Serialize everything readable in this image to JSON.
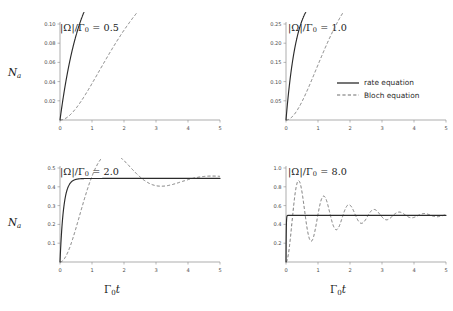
{
  "figure": {
    "axis_label_y": "N",
    "axis_label_y_sub": "a",
    "axis_label_x": "Γ",
    "axis_label_x_sub": "0",
    "axis_label_x_tail": "t",
    "background_color": "#ffffff",
    "solid_color": "#2b2b2b",
    "dashed_color": "#6e6e6e",
    "axis_color": "#8a8a8a"
  },
  "legend": {
    "position": "top-right-panel",
    "entries": [
      {
        "label": "rate equation",
        "style": "solid"
      },
      {
        "label": "Bloch equation",
        "style": "dashed"
      }
    ]
  },
  "chart_data": [
    {
      "type": "line",
      "panel": "top-left",
      "title": "|Ω|/Γ₀ = 0.5",
      "title_prefix": "|Ω|/Γ",
      "title_sub": "0",
      "title_value": "= 0.5",
      "rabi_ratio": 0.5,
      "xlabel": "Γ₀t",
      "ylabel": "Na",
      "xlim": [
        0,
        5
      ],
      "ylim": [
        0,
        0.1
      ],
      "xticks": [
        0,
        1,
        2,
        3,
        4,
        5
      ],
      "xtick_labels": [
        "0",
        "1",
        "2",
        "3",
        "4",
        "5"
      ],
      "yticks": [
        0.02,
        0.04,
        0.06,
        0.08,
        0.1
      ],
      "ytick_labels": [
        "0.02",
        "0.04",
        "0.06",
        "0.08",
        "0.10"
      ],
      "grid": false,
      "steady_state": 0.0556,
      "series": [
        {
          "name": "rate equation",
          "style": "solid",
          "model": "rate"
        },
        {
          "name": "Bloch equation",
          "style": "dashed",
          "model": "bloch"
        }
      ]
    },
    {
      "type": "line",
      "panel": "top-right",
      "title": "|Ω|/Γ₀ = 1.0",
      "title_prefix": "|Ω|/Γ",
      "title_sub": "0",
      "title_value": "= 1.0",
      "rabi_ratio": 1.0,
      "xlabel": "Γ₀t",
      "ylabel": "Na",
      "xlim": [
        0,
        5
      ],
      "ylim": [
        0,
        0.25
      ],
      "xticks": [
        0,
        1,
        2,
        3,
        4,
        5
      ],
      "xtick_labels": [
        "0",
        "1",
        "2",
        "3",
        "4",
        "5"
      ],
      "yticks": [
        0.05,
        0.1,
        0.15,
        0.2,
        0.25
      ],
      "ytick_labels": [
        "0.05",
        "0.10",
        "0.15",
        "0.20",
        "0.25"
      ],
      "grid": false,
      "steady_state": 0.1667,
      "series": [
        {
          "name": "rate equation",
          "style": "solid",
          "model": "rate"
        },
        {
          "name": "Bloch equation",
          "style": "dashed",
          "model": "bloch"
        }
      ]
    },
    {
      "type": "line",
      "panel": "bottom-left",
      "title": "|Ω|/Γ₀ = 2.0",
      "title_prefix": "|Ω|/Γ",
      "title_sub": "0",
      "title_value": "= 2.0",
      "rabi_ratio": 2.0,
      "xlabel": "Γ₀t",
      "ylabel": "Na",
      "xlim": [
        0,
        5
      ],
      "ylim": [
        0,
        0.5
      ],
      "xticks": [
        0,
        1,
        2,
        3,
        4,
        5
      ],
      "xtick_labels": [
        "0",
        "1",
        "2",
        "3",
        "4",
        "5"
      ],
      "yticks": [
        0.1,
        0.2,
        0.3,
        0.4,
        0.5
      ],
      "ytick_labels": [
        "0.1",
        "0.2",
        "0.3",
        "0.4",
        "0.5"
      ],
      "grid": false,
      "steady_state": 0.3333,
      "overshoot_peak": 0.372,
      "overshoot_time": 1.62,
      "series": [
        {
          "name": "rate equation",
          "style": "solid",
          "model": "rate"
        },
        {
          "name": "Bloch equation",
          "style": "dashed",
          "model": "bloch"
        }
      ]
    },
    {
      "type": "line",
      "panel": "bottom-right",
      "title": "|Ω|/Γ₀ = 8.0",
      "title_prefix": "|Ω|/Γ",
      "title_sub": "0",
      "title_value": "= 8.0",
      "rabi_ratio": 8.0,
      "xlabel": "Γ₀t",
      "ylabel": "Na",
      "xlim": [
        0,
        5
      ],
      "ylim": [
        0,
        1.0
      ],
      "xticks": [
        0,
        1,
        2,
        3,
        4,
        5
      ],
      "xtick_labels": [
        "0",
        "1",
        "2",
        "3",
        "4",
        "5"
      ],
      "yticks": [
        0.2,
        0.4,
        0.6,
        0.8,
        1.0
      ],
      "ytick_labels": [
        "0.2",
        "0.4",
        "0.6",
        "0.8",
        "1.0"
      ],
      "grid": false,
      "steady_state": 0.4848,
      "overshoot_peak": 0.755,
      "overshoot_time": 0.39,
      "series": [
        {
          "name": "rate equation",
          "style": "solid",
          "model": "rate"
        },
        {
          "name": "Bloch equation",
          "style": "dashed",
          "model": "bloch"
        }
      ]
    }
  ]
}
